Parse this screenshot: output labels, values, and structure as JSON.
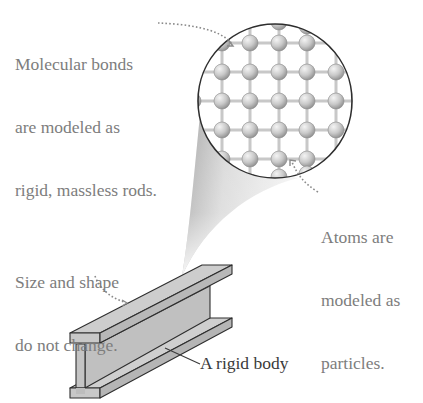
{
  "figure": {
    "annotations": {
      "bonds": {
        "lines": [
          "Molecular bonds",
          "are modeled as",
          "rigid, massless rods."
        ]
      },
      "atoms": {
        "lines": [
          "Atoms are",
          "modeled as",
          "particles."
        ]
      },
      "shape": {
        "lines": [
          "Size and shape",
          "do not change."
        ]
      },
      "body": {
        "label": "A rigid body"
      }
    },
    "magnifier": {
      "center": [
        275,
        101
      ],
      "radius": 78,
      "lattice_spacing": 29
    },
    "colors": {
      "text_annotation": "#7d7d7d",
      "text_label": "#3a3a3a",
      "atom_fill": "#c9c9c9",
      "rod": "#c8c8c8",
      "beam_fill": "#c4c4c4",
      "outline": "#2e2e2e"
    }
  }
}
